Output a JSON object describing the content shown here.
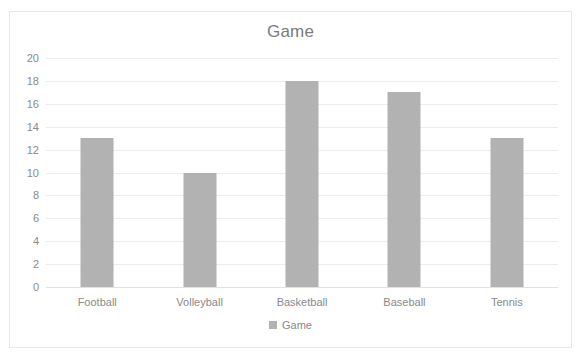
{
  "chart_data": {
    "type": "bar",
    "title": "Game",
    "xlabel": "",
    "ylabel": "",
    "categories": [
      "Football",
      "Volleyball",
      "Basketball",
      "Baseball",
      "Tennis"
    ],
    "values": [
      13,
      10,
      18,
      17,
      13
    ],
    "series": [
      {
        "name": "Game",
        "values": [
          13,
          10,
          18,
          17,
          13
        ]
      }
    ],
    "ylim": [
      0,
      20
    ],
    "ytick_step": 2,
    "yticks": [
      20,
      18,
      16,
      14,
      12,
      10,
      8,
      6,
      4,
      2,
      0
    ],
    "grid": true,
    "legend": {
      "position": "bottom",
      "entries": [
        "Game"
      ]
    },
    "colors": {
      "bar": "#b2b2b2",
      "gridline": "#ededed",
      "text": "#8a8a8a",
      "title_text": "#7b7b7b",
      "frame_border": "#e8e8e8",
      "background": "#ffffff"
    }
  },
  "legend": {
    "marker_icon": "square-marker-icon",
    "label": "Game"
  }
}
